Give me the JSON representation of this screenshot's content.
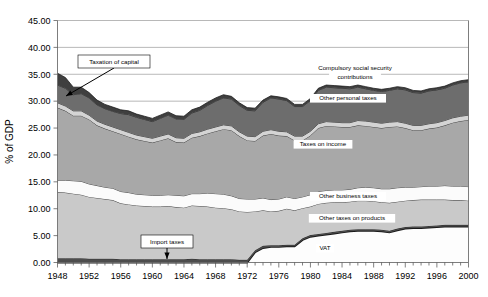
{
  "chart_data": {
    "type": "area",
    "title": "",
    "xlabel": "",
    "ylabel": "% of GDP",
    "xlim": [
      1948,
      2000
    ],
    "ylim": [
      0.0,
      45.0
    ],
    "ytick_step": 5.0,
    "ytick_labels": [
      "0.00",
      "5.00",
      "10.00",
      "15.00",
      "20.00",
      "25.00",
      "30.00",
      "35.00",
      "40.00",
      "45.00"
    ],
    "xtick_labels": [
      "1948",
      "1952",
      "1956",
      "1960",
      "1964",
      "1968",
      "1972",
      "1976",
      "1980",
      "1984",
      "1988",
      "1992",
      "1996",
      "2000"
    ],
    "xtick_step": 4,
    "minor_xtick_step": 1,
    "grid": "horizontal",
    "legend": "inline-labels",
    "stacked": true,
    "x": [
      1948,
      1949,
      1950,
      1951,
      1952,
      1953,
      1954,
      1955,
      1956,
      1957,
      1958,
      1959,
      1960,
      1961,
      1962,
      1963,
      1964,
      1965,
      1966,
      1967,
      1968,
      1969,
      1970,
      1971,
      1972,
      1973,
      1974,
      1975,
      1976,
      1977,
      1978,
      1979,
      1980,
      1981,
      1982,
      1983,
      1984,
      1985,
      1986,
      1987,
      1988,
      1989,
      1990,
      1991,
      1992,
      1993,
      1994,
      1995,
      1996,
      1997,
      1998,
      1999,
      2000
    ],
    "series": [
      {
        "name": "VAT",
        "color": "#fdfdfd",
        "values": [
          0.0,
          0.0,
          0.0,
          0.0,
          0.0,
          0.0,
          0.0,
          0.0,
          0.0,
          0.0,
          0.0,
          0.0,
          0.0,
          0.0,
          0.0,
          0.0,
          0.0,
          0.0,
          0.0,
          0.0,
          0.0,
          0.0,
          0.0,
          0.0,
          0.0,
          1.9,
          2.7,
          2.9,
          2.9,
          3.0,
          3.0,
          4.2,
          4.8,
          5.0,
          5.2,
          5.4,
          5.6,
          5.8,
          5.9,
          5.9,
          5.9,
          5.8,
          5.6,
          6.0,
          6.3,
          6.4,
          6.4,
          6.5,
          6.6,
          6.7,
          6.7,
          6.7,
          6.7
        ]
      },
      {
        "name": "Import taxes",
        "color": "#4d4d4d",
        "values": [
          0.8,
          0.8,
          0.8,
          0.8,
          0.7,
          0.7,
          0.7,
          0.7,
          0.6,
          0.6,
          0.6,
          0.6,
          0.6,
          0.6,
          0.6,
          0.6,
          0.6,
          0.7,
          0.6,
          0.6,
          0.6,
          0.6,
          0.6,
          0.5,
          0.5,
          0.4,
          0.4,
          0.3,
          0.3,
          0.3,
          0.3,
          0.3,
          0.3,
          0.3,
          0.3,
          0.3,
          0.3,
          0.3,
          0.3,
          0.3,
          0.3,
          0.3,
          0.3,
          0.3,
          0.3,
          0.3,
          0.3,
          0.3,
          0.3,
          0.3,
          0.3,
          0.3,
          0.3
        ]
      },
      {
        "name": "Other taxes on products",
        "color": "#c9c9c9",
        "values": [
          12.3,
          12.2,
          12.0,
          11.8,
          11.5,
          11.3,
          11.1,
          10.9,
          10.4,
          10.2,
          10.0,
          9.9,
          9.8,
          9.8,
          9.9,
          9.7,
          9.6,
          9.9,
          9.9,
          9.8,
          9.6,
          9.5,
          9.3,
          9.0,
          8.9,
          7.2,
          6.6,
          6.3,
          6.4,
          6.7,
          6.4,
          5.6,
          5.3,
          5.6,
          5.6,
          5.5,
          5.3,
          5.2,
          5.3,
          5.3,
          5.2,
          5.1,
          5.2,
          5.0,
          4.9,
          4.9,
          5.0,
          4.9,
          4.8,
          4.7,
          4.6,
          4.6,
          4.5
        ]
      },
      {
        "name": "Other business taxes",
        "color": "#fbfbfb",
        "values": [
          2.2,
          2.3,
          2.4,
          2.5,
          2.4,
          2.3,
          2.2,
          2.2,
          2.2,
          2.2,
          2.1,
          2.1,
          2.1,
          2.1,
          2.1,
          2.2,
          2.2,
          2.2,
          2.3,
          2.5,
          2.6,
          2.6,
          2.5,
          2.4,
          2.4,
          2.3,
          2.3,
          2.2,
          2.2,
          2.2,
          2.2,
          2.1,
          2.2,
          2.3,
          2.3,
          2.3,
          2.3,
          2.3,
          2.4,
          2.5,
          2.5,
          2.5,
          2.6,
          2.6,
          2.5,
          2.4,
          2.4,
          2.5,
          2.5,
          2.6,
          2.6,
          2.6,
          2.6
        ]
      },
      {
        "name": "Taxes on income",
        "color": "#a8a8a8",
        "values": [
          13.5,
          12.9,
          12.1,
          12.2,
          12.0,
          11.2,
          10.9,
          10.6,
          10.7,
          10.4,
          10.2,
          10.0,
          9.8,
          10.2,
          10.5,
          9.9,
          9.9,
          10.4,
          10.7,
          11.1,
          11.6,
          12.1,
          12.2,
          11.6,
          10.9,
          10.8,
          11.6,
          12.2,
          11.8,
          11.3,
          10.8,
          10.5,
          11.0,
          11.8,
          12.0,
          11.8,
          11.7,
          11.6,
          11.6,
          11.4,
          11.3,
          11.3,
          11.5,
          11.4,
          11.0,
          10.6,
          10.5,
          10.7,
          10.9,
          11.2,
          11.8,
          12.1,
          12.4
        ]
      },
      {
        "name": "Other personal taxes",
        "color": "#d4d4d4",
        "values": [
          0.9,
          0.9,
          0.9,
          0.9,
          0.8,
          0.8,
          0.8,
          0.8,
          0.8,
          0.8,
          0.8,
          0.8,
          0.8,
          0.8,
          0.8,
          0.8,
          0.8,
          0.8,
          0.8,
          0.8,
          0.8,
          0.8,
          0.8,
          0.8,
          0.8,
          0.8,
          0.8,
          0.8,
          0.8,
          0.8,
          0.8,
          0.8,
          0.8,
          0.8,
          0.8,
          0.8,
          0.8,
          0.8,
          0.9,
          0.9,
          0.9,
          0.9,
          0.9,
          0.9,
          0.9,
          0.9,
          0.9,
          0.9,
          0.9,
          0.9,
          0.9,
          0.9,
          0.9
        ]
      },
      {
        "name": "Compulsory social security contributions",
        "color": "#6d6d6d",
        "values": [
          3.3,
          3.3,
          3.0,
          3.2,
          3.2,
          3.0,
          2.9,
          2.9,
          3.0,
          3.3,
          3.3,
          3.2,
          3.1,
          3.3,
          3.5,
          3.5,
          3.5,
          3.8,
          4.0,
          4.4,
          4.8,
          5.0,
          5.0,
          4.9,
          4.8,
          4.8,
          5.4,
          5.9,
          6.0,
          5.8,
          5.5,
          5.5,
          5.7,
          6.2,
          6.4,
          6.4,
          6.4,
          6.3,
          6.2,
          6.0,
          5.9,
          5.9,
          5.9,
          6.1,
          6.2,
          6.1,
          6.0,
          6.1,
          6.1,
          6.0,
          6.1,
          6.2,
          6.2
        ]
      },
      {
        "name": "Taxation of capital",
        "color": "#3f3f3f",
        "values": [
          2.2,
          2.0,
          1.4,
          1.2,
          1.0,
          0.9,
          0.8,
          0.8,
          0.7,
          0.7,
          0.6,
          0.6,
          0.6,
          0.6,
          0.6,
          0.6,
          0.6,
          0.6,
          0.6,
          0.6,
          0.6,
          0.6,
          0.5,
          0.5,
          0.5,
          0.5,
          0.4,
          0.4,
          0.4,
          0.4,
          0.4,
          0.4,
          0.4,
          0.4,
          0.4,
          0.4,
          0.4,
          0.4,
          0.4,
          0.4,
          0.4,
          0.4,
          0.4,
          0.4,
          0.4,
          0.4,
          0.4,
          0.4,
          0.4,
          0.4,
          0.4,
          0.4,
          0.4
        ]
      }
    ],
    "annotations": [
      {
        "text": "Taxation of capital",
        "box_x": 78,
        "box_y": 55,
        "box_w": 72,
        "box_h": 13,
        "arrow_to_x": 66,
        "arrow_to_y": 96
      },
      {
        "text": "Import taxes",
        "box_x": 141,
        "box_y": 235,
        "box_w": 52,
        "box_h": 13,
        "arrow_to_x": 167,
        "arrow_to_y": 259
      }
    ],
    "inline_labels": [
      {
        "text": "Compulsory social security",
        "x": 355,
        "y": 70
      },
      {
        "text": "contributions",
        "x": 355,
        "y": 79
      },
      {
        "text": "Other personal taxes",
        "x": 348,
        "y": 100
      },
      {
        "text": "Taxes on income",
        "x": 323,
        "y": 146
      },
      {
        "text": "Other business taxes",
        "x": 348,
        "y": 198
      },
      {
        "text": "Other taxes on products",
        "x": 352,
        "y": 220
      },
      {
        "text": "VAT",
        "x": 325,
        "y": 250
      }
    ]
  }
}
